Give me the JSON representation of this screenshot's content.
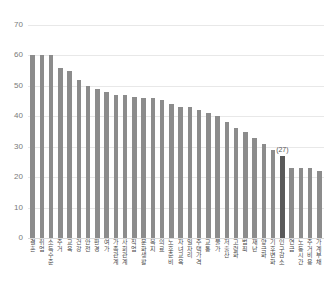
{
  "chart_data": {
    "type": "bar",
    "title": "",
    "subtitle": "",
    "xlabel": "",
    "ylabel": "",
    "ylim": [
      0,
      70
    ],
    "yticks": [
      0,
      10,
      20,
      30,
      40,
      50,
      60,
      70
    ],
    "grid": true,
    "legend": null,
    "categories": [
      "결혼",
      "취업",
      "소득수준",
      "주거",
      "교육",
      "건강",
      "안전",
      "환경",
      "여가",
      "가족관계",
      "사회관계",
      "직업",
      "문화생활",
      "복지",
      "의료",
      "노후준비",
      "자녀교육",
      "일자리",
      "주택가격",
      "교통",
      "물가",
      "저출산",
      "고령화",
      "범죄",
      "재난",
      "양극화",
      "기후변화",
      "인구감소",
      "연금",
      "노동시간",
      "주거비용",
      "가계부채"
    ],
    "values": [
      60,
      60,
      60,
      56,
      55,
      52,
      50,
      49,
      48,
      47,
      47,
      46.5,
      46,
      46,
      45.5,
      44,
      43,
      43,
      42,
      41,
      40,
      38,
      36,
      35,
      33,
      31,
      29,
      27,
      23,
      23,
      23,
      22
    ],
    "annotations": [
      {
        "index": 27,
        "text": "(27)",
        "value": 27
      }
    ],
    "highlight_index": 27,
    "colors": {
      "bar": "#8c8c8c",
      "bar_highlight": "#5a5a5a",
      "grid": "#e8e8e8",
      "axis_text": "#7a7a7a",
      "label_text": "#4a4a4a"
    }
  }
}
